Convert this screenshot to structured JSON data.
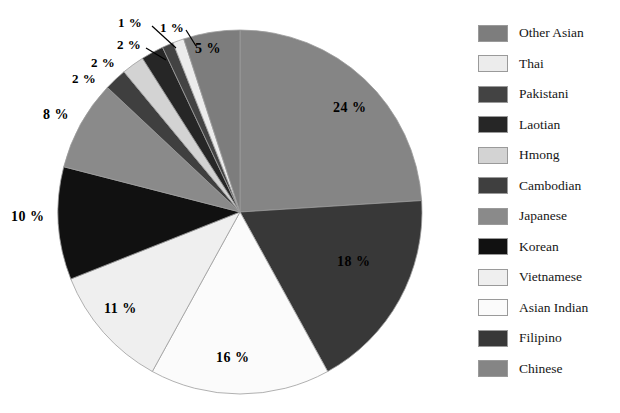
{
  "chart_data": {
    "type": "pie",
    "title": "",
    "xlabel": "",
    "ylabel": "",
    "label_suffix": "%",
    "start_angle_deg": 0,
    "direction": "clockwise",
    "categories": [
      "Chinese",
      "Filipino",
      "Asian Indian",
      "Vietnamese",
      "Korean",
      "Japanese",
      "Cambodian",
      "Hmong",
      "Laotian",
      "Pakistani",
      "Thai",
      "Other Asian"
    ],
    "values": [
      24,
      18,
      16,
      11,
      10,
      8,
      2,
      2,
      2,
      1,
      1,
      5
    ],
    "slice_labels": [
      "24 %",
      "18 %",
      "16 %",
      "11 %",
      "10 %",
      "8 %",
      "2 %",
      "2 %",
      "2 %",
      "1 %",
      "1 %",
      "5 %"
    ],
    "colors": [
      "#858585",
      "#383838",
      "#fbfbfb",
      "#efefef",
      "#111111",
      "#8a8a8a",
      "#3f3f3f",
      "#d3d3d3",
      "#262626",
      "#434343",
      "#ececec",
      "#7d7d7d"
    ],
    "legend_position": "right",
    "grid": false
  },
  "title_sliver": " ",
  "legend": {
    "items": [
      {
        "label": "Other Asian",
        "color": "#7d7d7d",
        "value": 5
      },
      {
        "label": "Thai",
        "color": "#ececec",
        "value": 1
      },
      {
        "label": "Pakistani",
        "color": "#434343",
        "value": 1
      },
      {
        "label": "Laotian",
        "color": "#262626",
        "value": 2
      },
      {
        "label": "Hmong",
        "color": "#d3d3d3",
        "value": 2
      },
      {
        "label": "Cambodian",
        "color": "#3f3f3f",
        "value": 2
      },
      {
        "label": "Japanese",
        "color": "#8a8a8a",
        "value": 8
      },
      {
        "label": "Korean",
        "color": "#111111",
        "value": 10
      },
      {
        "label": "Vietnamese",
        "color": "#efefef",
        "value": 11
      },
      {
        "label": "Asian Indian",
        "color": "#fbfbfb",
        "value": 16
      },
      {
        "label": "Filipino",
        "color": "#383838",
        "value": 18
      },
      {
        "label": "Chinese",
        "color": "#858585",
        "value": 24
      }
    ]
  },
  "pie_labels": [
    {
      "text": "24 %",
      "x": 333,
      "y": 100
    },
    {
      "text": "18 %",
      "x": 337,
      "y": 254
    },
    {
      "text": "16 %",
      "x": 216,
      "y": 350
    },
    {
      "text": "11 %",
      "x": 104,
      "y": 301
    },
    {
      "text": "10 %",
      "x": 11,
      "y": 209
    },
    {
      "text": "8 %",
      "x": 43,
      "y": 107
    },
    {
      "text": "2 %",
      "x": 72,
      "y": 71
    },
    {
      "text": "2 %",
      "x": 91,
      "y": 55
    },
    {
      "text": "2 %",
      "x": 117,
      "y": 37
    },
    {
      "text": "1 %",
      "x": 118,
      "y": 15
    },
    {
      "text": "1 %",
      "x": 160,
      "y": 20
    },
    {
      "text": "5 %",
      "x": 195,
      "y": 41
    }
  ]
}
